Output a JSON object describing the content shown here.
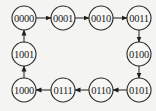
{
  "diagram": {
    "type": "state-transition",
    "nodes": [
      {
        "id": "s0",
        "label": "0000",
        "x": 24,
        "y": 18
      },
      {
        "id": "s1",
        "label": "0001",
        "x": 63,
        "y": 18
      },
      {
        "id": "s2",
        "label": "0010",
        "x": 101,
        "y": 18
      },
      {
        "id": "s3",
        "label": "0011",
        "x": 139,
        "y": 18
      },
      {
        "id": "s4",
        "label": "0100",
        "x": 139,
        "y": 54
      },
      {
        "id": "s5",
        "label": "0101",
        "x": 139,
        "y": 90
      },
      {
        "id": "s6",
        "label": "0110",
        "x": 101,
        "y": 90
      },
      {
        "id": "s7",
        "label": "0111",
        "x": 63,
        "y": 90
      },
      {
        "id": "s8",
        "label": "1000",
        "x": 24,
        "y": 90
      },
      {
        "id": "s9",
        "label": "1001",
        "x": 24,
        "y": 54
      }
    ],
    "edges": [
      {
        "from": "s0",
        "to": "s1"
      },
      {
        "from": "s1",
        "to": "s2"
      },
      {
        "from": "s2",
        "to": "s3"
      },
      {
        "from": "s3",
        "to": "s4"
      },
      {
        "from": "s4",
        "to": "s5"
      },
      {
        "from": "s5",
        "to": "s6"
      },
      {
        "from": "s6",
        "to": "s7"
      },
      {
        "from": "s7",
        "to": "s8"
      },
      {
        "from": "s8",
        "to": "s9"
      },
      {
        "from": "s9",
        "to": "s0"
      }
    ],
    "node_radius": 12
  }
}
